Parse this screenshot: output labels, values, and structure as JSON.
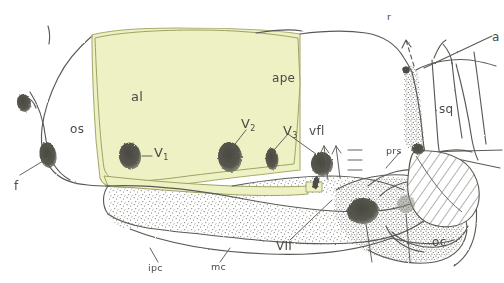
{
  "figure": {
    "kind": "anatomical-line-drawing",
    "view": "lateral view of skull / cranial wall",
    "background_color": "#ffffff",
    "ink_color": "#5a5a55",
    "highlight_color": "#eef1c4",
    "highlight_stroke": "#a9ad6e",
    "stipple_color": "#6f6f68"
  },
  "labels": {
    "al": "al",
    "os": "os",
    "f": "f",
    "v1": "V",
    "v1_sub": "1",
    "v2": "V",
    "v2_sub": "2",
    "v3": "V",
    "v3_sub": "3",
    "vfl": "vfl",
    "ape": "ape",
    "sq": "sq",
    "prs": "prs",
    "oc": "oc",
    "vii": "VII",
    "mc": "mc",
    "ipc": "ipc",
    "r": "r",
    "a": "a"
  },
  "regions": {
    "highlighted_area_label": "al",
    "hatched_area_label": "prs",
    "stippled_areas": [
      "ape-floor",
      "mc-band",
      "posterior-block"
    ]
  },
  "markers": {
    "filled_ovals": [
      "f-upper",
      "f-lower",
      "V1",
      "V2",
      "V3",
      "vfl",
      "VII",
      "sq-contact"
    ],
    "dashed_arrow": "r",
    "solid_arrows": [
      "vfl-anterior",
      "vfl-posterior"
    ]
  }
}
